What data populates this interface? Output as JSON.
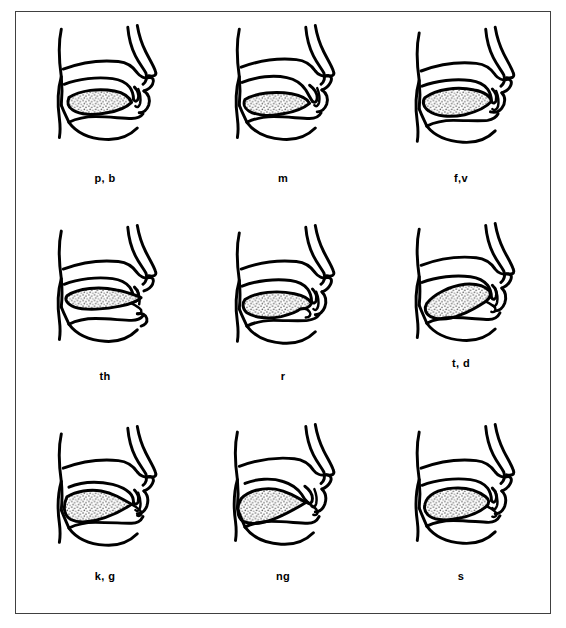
{
  "figure": {
    "type": "articulation-placement-chart",
    "border_color": "#404040",
    "ink_color": "#000000",
    "tongue_fill": "stippled-gray",
    "background_color": "#ffffff",
    "rows": 3,
    "columns": 3
  },
  "panels": [
    {
      "id": "panel-p-b",
      "label": "p, b",
      "sound_name": "bilabial-stop",
      "row": 0,
      "column": 0,
      "velum": "raised",
      "lips": "closed",
      "tongue_position": "low-flat",
      "label_raised": false
    },
    {
      "id": "panel-m",
      "label": "m",
      "sound_name": "bilabial-nasal",
      "row": 0,
      "column": 1,
      "velum": "lowered",
      "lips": "closed",
      "tongue_position": "low-flat",
      "label_raised": false
    },
    {
      "id": "panel-f-v",
      "label": "f,v",
      "sound_name": "labiodental-fricative",
      "row": 0,
      "column": 2,
      "velum": "raised",
      "lips": "lower-lip-to-upper-teeth",
      "tongue_position": "low-mid",
      "label_raised": false
    },
    {
      "id": "panel-th",
      "label": "th",
      "sound_name": "interdental-fricative",
      "row": 1,
      "column": 0,
      "velum": "raised",
      "lips": "open",
      "tongue_position": "tip-between-teeth",
      "label_raised": false
    },
    {
      "id": "panel-r",
      "label": "r",
      "sound_name": "retroflex-approximant",
      "row": 1,
      "column": 1,
      "velum": "raised",
      "lips": "slightly-rounded",
      "tongue_position": "tip-curled-up",
      "label_raised": false
    },
    {
      "id": "panel-t-d",
      "label": "t, d",
      "sound_name": "alveolar-stop",
      "row": 1,
      "column": 2,
      "velum": "raised",
      "lips": "open",
      "tongue_position": "tip-to-alveolar-ridge",
      "label_raised": true
    },
    {
      "id": "panel-k-g",
      "label": "k, g",
      "sound_name": "velar-stop",
      "row": 2,
      "column": 0,
      "velum": "raised",
      "lips": "open",
      "tongue_position": "back-raised-to-velum",
      "label_raised": false
    },
    {
      "id": "panel-ng",
      "label": "ng",
      "sound_name": "velar-nasal",
      "row": 2,
      "column": 1,
      "velum": "lowered",
      "lips": "open",
      "tongue_position": "back-raised-to-velum",
      "label_raised": false
    },
    {
      "id": "panel-s",
      "label": "s",
      "sound_name": "alveolar-fricative",
      "row": 2,
      "column": 2,
      "velum": "raised",
      "lips": "slightly-open",
      "tongue_position": "blade-near-alveolar-ridge",
      "label_raised": false
    }
  ]
}
